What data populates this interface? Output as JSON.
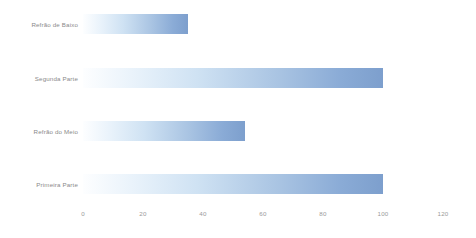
{
  "chart_data": {
    "type": "bar",
    "orientation": "horizontal",
    "title": "",
    "subtitle": "",
    "xlabel": "",
    "ylabel": "",
    "categories": [
      "Refrão de Baixo",
      "Segunda Parte",
      "Refrão do Meio",
      "Primeira Parte"
    ],
    "values": [
      35,
      100,
      54,
      100
    ],
    "xlim": [
      0,
      120
    ],
    "xticks": [
      0,
      20,
      40,
      60,
      80,
      100,
      120
    ],
    "xtick_labels": [
      "0",
      "20",
      "40",
      "60",
      "80",
      "100",
      "120"
    ],
    "grid": false,
    "legend": null,
    "legend_position": "none",
    "annotations": [],
    "bar_gradient_start": "#fdfeff",
    "bar_gradient_end": "#7d9fcd",
    "background_color": "#ffffff",
    "label_color": "#8a8a8a",
    "tick_color": "#9a9a9a"
  }
}
